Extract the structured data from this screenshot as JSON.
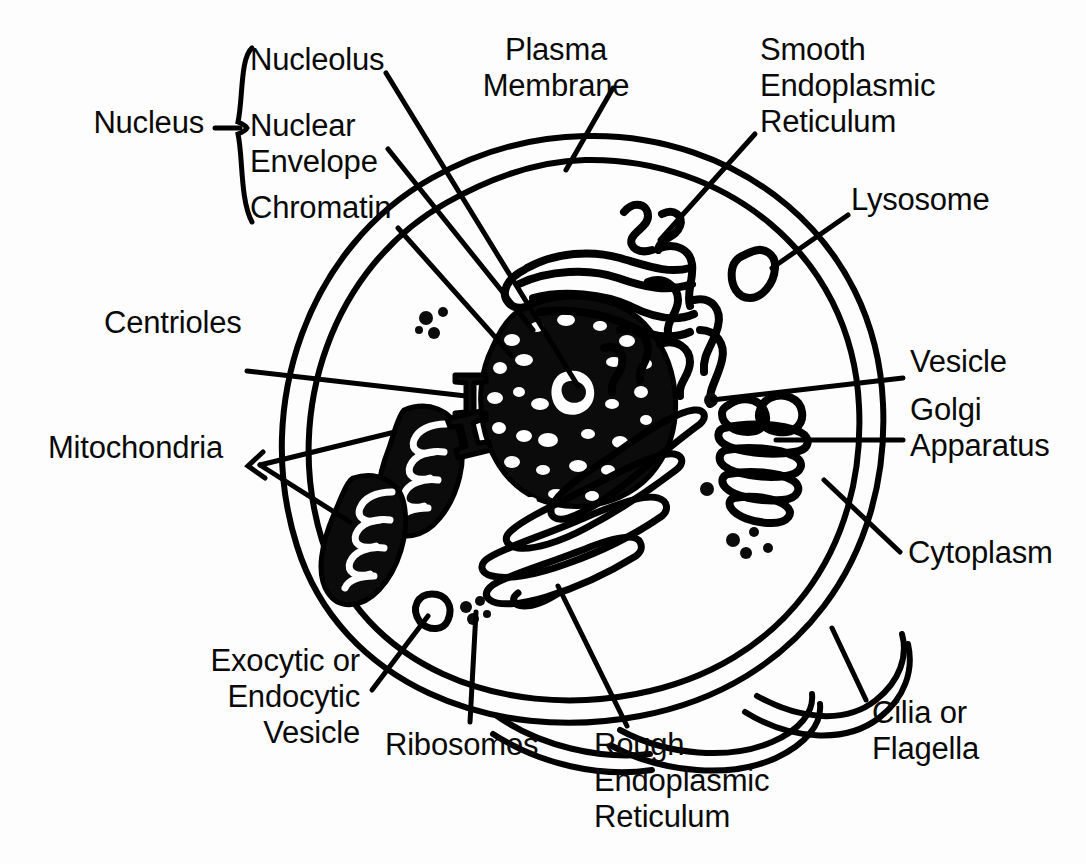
{
  "figure": {
    "kind": "animal-cell-diagram",
    "background_color": "#fdfdfd",
    "ink_color": "#000000"
  },
  "labels": {
    "nucleus": "Nucleus",
    "nucleolus": "Nucleolus",
    "nuclear_envelope": "Nuclear\nEnvelope",
    "chromatin": "Chromatin",
    "plasma_membrane": "Plasma\nMembrane",
    "smooth_er": "Smooth\nEndoplasmic\nReticulum",
    "lysosome": "Lysosome",
    "vesicle": "Vesicle",
    "golgi": "Golgi\nApparatus",
    "cytoplasm": "Cytoplasm",
    "cilia": "Cilia or\nFlagella",
    "rough_er": "Rough\nEndoplasmic\nReticulum",
    "ribosomes": "Ribosomes",
    "exocytic_vesicle": "Exocytic or\nEndocytic\nVesicle",
    "mitochondria": "Mitochondria",
    "centrioles": "Centrioles"
  }
}
